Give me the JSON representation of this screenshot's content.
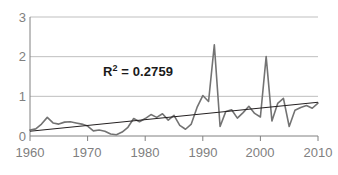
{
  "chart_data": {
    "type": "line",
    "title": "",
    "xlabel": "",
    "ylabel": "",
    "xlim": [
      1960,
      2010
    ],
    "ylim": [
      0,
      3
    ],
    "grid": true,
    "legend": false,
    "xticks": [
      1960,
      1970,
      1980,
      1990,
      2000,
      2010
    ],
    "yticks": [
      0,
      1,
      2,
      3
    ],
    "annotations": [
      {
        "text": "R² = 0.2759",
        "base": "R",
        "sup": "2",
        "rest": " = 0.2759",
        "x": 1972,
        "y": 1.55
      }
    ],
    "series": [
      {
        "name": "data",
        "color": "#737373",
        "x": [
          1960,
          1961,
          1962,
          1963,
          1964,
          1965,
          1966,
          1967,
          1968,
          1969,
          1970,
          1971,
          1972,
          1973,
          1974,
          1975,
          1976,
          1977,
          1978,
          1979,
          1980,
          1981,
          1982,
          1983,
          1984,
          1985,
          1986,
          1987,
          1988,
          1989,
          1990,
          1991,
          1992,
          1993,
          1994,
          1995,
          1996,
          1997,
          1998,
          1999,
          2000,
          2001,
          2002,
          2003,
          2004,
          2005,
          2006,
          2007,
          2008,
          2009,
          2010
        ],
        "values": [
          0.15,
          0.18,
          0.3,
          0.47,
          0.33,
          0.3,
          0.35,
          0.36,
          0.33,
          0.3,
          0.25,
          0.13,
          0.15,
          0.12,
          0.05,
          0.03,
          0.1,
          0.22,
          0.44,
          0.36,
          0.44,
          0.54,
          0.47,
          0.56,
          0.4,
          0.52,
          0.27,
          0.17,
          0.3,
          0.72,
          1.02,
          0.87,
          2.3,
          0.24,
          0.62,
          0.66,
          0.45,
          0.59,
          0.75,
          0.57,
          0.48,
          2.0,
          0.38,
          0.82,
          0.95,
          0.24,
          0.65,
          0.72,
          0.77,
          0.7,
          0.83
        ]
      },
      {
        "name": "linear-trendline",
        "color": "#231f20",
        "x": [
          1960,
          2010
        ],
        "values": [
          0.12,
          0.85
        ]
      }
    ]
  },
  "axis": {
    "y_tick_labels": [
      "3",
      "2",
      "1",
      "0"
    ],
    "x_tick_labels": [
      "1960",
      "1970",
      "1980",
      "1990",
      "2000",
      "2010"
    ]
  },
  "colors": {
    "data_line": "#737373",
    "trendline": "#231f20",
    "gridline": "#bfbfbf",
    "axis": "#808080",
    "tick_text": "#808080",
    "annotation_text": "#1a1a1a",
    "background": "#ffffff"
  }
}
